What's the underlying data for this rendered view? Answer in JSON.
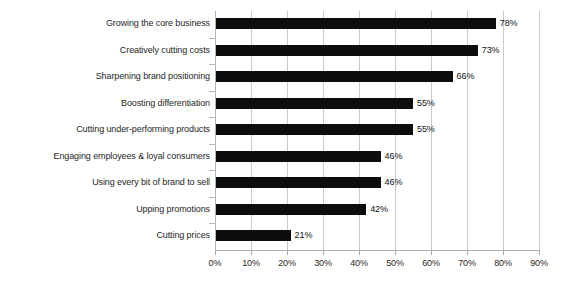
{
  "chart_data": {
    "type": "bar",
    "orientation": "horizontal",
    "title": "",
    "subtitle": "",
    "xlabel": "",
    "ylabel": "",
    "xlim": [
      0,
      90
    ],
    "xtick_step": 10,
    "xtick_labels": [
      "0%",
      "10%",
      "20%",
      "30%",
      "40%",
      "50%",
      "60%",
      "70%",
      "80%",
      "90%"
    ],
    "xtick_values": [
      0,
      10,
      20,
      30,
      40,
      50,
      60,
      70,
      80,
      90
    ],
    "grid": "vertical",
    "legend": "none",
    "value_suffix": "%",
    "categories": [
      "Growing the core business",
      "Creatively cutting costs",
      "Sharpening brand positioning",
      "Boosting differentiation",
      "Cutting under-performing products",
      "Engaging employees & loyal consumers",
      "Using every bit of brand to sell",
      "Upping promotions",
      "Cutting prices"
    ],
    "values": [
      78,
      73,
      66,
      55,
      55,
      46,
      46,
      42,
      21
    ],
    "data_labels": [
      "78%",
      "73%",
      "66%",
      "55%",
      "55%",
      "46%",
      "46%",
      "42%",
      "21%"
    ],
    "colors": {
      "bar": "#0d0d0d",
      "gridline": "#c9c9c9",
      "axis": "#b0b0b0",
      "text": "#1f1f1f",
      "background": "#ffffff"
    }
  }
}
